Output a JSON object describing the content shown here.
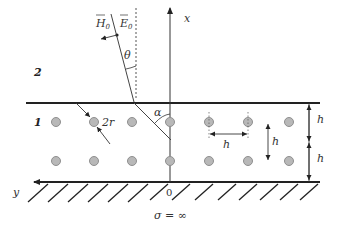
{
  "diagram": {
    "type": "physics-schematic",
    "labels": {
      "region_upper": "2",
      "region_layer": "1",
      "x_axis": "x",
      "y_axis": "y",
      "origin": "0",
      "H0": "H",
      "H0_sub": "0",
      "E0": "E",
      "E0_sub": "0",
      "theta": "θ",
      "alpha": "α",
      "diameter": "2r",
      "h_horizontal": "h",
      "h_vertical": "h",
      "h_right_top": "h",
      "h_right_bottom": "h",
      "conductivity": "σ = ∞"
    },
    "colors": {
      "line": "#222222",
      "cylinder_fill": "#b8b8b8",
      "cylinder_stroke": "#8a8a8a",
      "dotted": "#555555"
    },
    "cylinders": {
      "rows": 2,
      "columns": 8,
      "row_y": [
        121,
        160
      ],
      "column_x": [
        55,
        94,
        133,
        172,
        211,
        250,
        289
      ]
    }
  }
}
